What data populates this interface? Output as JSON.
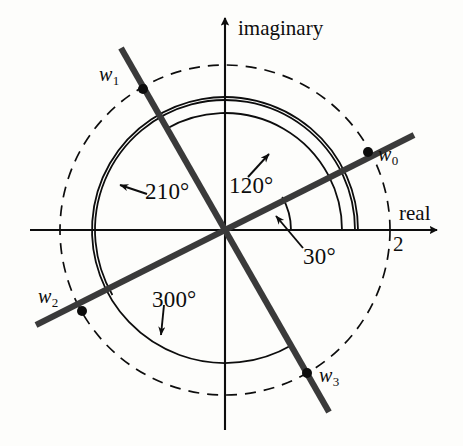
{
  "figure": {
    "type": "complex-plane-roots-diagram",
    "background": "#fdfdfb",
    "ink": "#0d0d0d",
    "origin": {
      "x": 225,
      "y": 230
    },
    "unit_radius_px": 82.5,
    "axes": {
      "imaginary_label": "imaginary",
      "real_label": "real",
      "real_tick_label": "2",
      "real_tick_value": 2
    },
    "roots": [
      {
        "id": "w0",
        "label": "w",
        "index": "0",
        "angle_deg": 30,
        "modulus": 2,
        "point": {
          "x": 368,
          "y": 152
        },
        "label_pos": {
          "x": 379,
          "y": 146
        }
      },
      {
        "id": "w1",
        "label": "w",
        "index": "1",
        "angle_deg": 120,
        "modulus": 2,
        "point": {
          "x": 143,
          "y": 89
        },
        "label_pos": {
          "x": 101,
          "y": 66
        }
      },
      {
        "id": "w2",
        "label": "w",
        "index": "2",
        "angle_deg": 210,
        "modulus": 2,
        "point": {
          "x": 82,
          "y": 311
        },
        "label_pos": {
          "x": 40,
          "y": 288
        }
      },
      {
        "id": "w3",
        "label": "w",
        "index": "3",
        "angle_deg": 300,
        "modulus": 2,
        "point": {
          "x": 307,
          "y": 373
        },
        "label_pos": {
          "x": 320,
          "y": 367
        }
      }
    ],
    "angle_annotations": [
      {
        "id": "ang-30",
        "text": "30°",
        "angle_deg": 30,
        "arc_radius_px": 66,
        "label_pos": {
          "x": 305,
          "y": 247
        },
        "arrow_from": {
          "x": 303,
          "y": 248
        },
        "arrow_to": {
          "x": 274,
          "y": 214
        }
      },
      {
        "id": "ang-120",
        "text": "120°",
        "angle_deg": 120,
        "arc_radius_px": 85,
        "label_pos": {
          "x": 231,
          "y": 175
        },
        "arrow_from": {
          "x": 247,
          "y": 176
        },
        "arrow_to": {
          "x": 270,
          "y": 152
        }
      },
      {
        "id": "ang-210",
        "text": "210°",
        "angle_deg": 210,
        "arc_radius_px": 115,
        "label_pos": {
          "x": 148,
          "y": 181
        },
        "arrow_from": {
          "x": 146,
          "y": 194
        },
        "arrow_to": {
          "x": 118,
          "y": 184
        }
      },
      {
        "id": "ang-300",
        "text": "300°",
        "angle_deg": 300,
        "arc_radius_px": 133,
        "label_pos": {
          "x": 155,
          "y": 290
        },
        "arrow_from": {
          "x": 163,
          "y": 305
        },
        "arrow_to": {
          "x": 160,
          "y": 338
        }
      }
    ],
    "circles": [
      {
        "id": "outer-dashed-circle",
        "radius_px": 165,
        "style": "dashed",
        "note": "|w| = 2"
      },
      {
        "id": "arc-210",
        "radius_px": 130,
        "style": "solid"
      },
      {
        "id": "arc-120",
        "radius_px": 117,
        "style": "solid"
      },
      {
        "id": "arc-30",
        "radius_px": 105,
        "style": "solid"
      }
    ],
    "lines": [
      {
        "id": "line-w0-w2",
        "through_angles_deg": [
          30,
          210
        ]
      },
      {
        "id": "line-w1-w3",
        "through_angles_deg": [
          120,
          300
        ]
      }
    ]
  }
}
